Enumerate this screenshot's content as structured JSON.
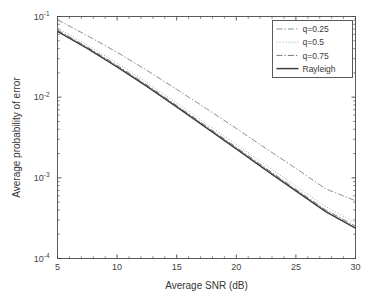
{
  "figure": {
    "background_color": "#ffffff",
    "frame_color": "#4a4a4a"
  },
  "axis": {
    "x_title": "Average SNR (dB)",
    "y_title": "Average probability of error",
    "x_ticks": [
      "5",
      "10",
      "15",
      "20",
      "25",
      "30"
    ],
    "y_ticks": [
      {
        "mantissa": "10",
        "exponent": "-1"
      },
      {
        "mantissa": "10",
        "exponent": "-2"
      },
      {
        "mantissa": "10",
        "exponent": "-3"
      },
      {
        "mantissa": "10",
        "exponent": "-4"
      }
    ]
  },
  "legend": {
    "entries": [
      {
        "label": "q=0.25",
        "style": "dashdot",
        "color": "#8f8f8f"
      },
      {
        "label": "q=0.5",
        "style": "dotted",
        "color": "#a8a8a8"
      },
      {
        "label": "q=0.75",
        "style": "dashdot",
        "color": "#777777"
      },
      {
        "label": "Rayleigh",
        "style": "solid",
        "color": "#3c3c3c"
      }
    ]
  },
  "chart_data": {
    "type": "line",
    "title": "",
    "xlabel": "Average SNR (dB)",
    "ylabel": "Average probability of error",
    "xlim": [
      5,
      30
    ],
    "ylim": [
      0.0001,
      0.1
    ],
    "yscale": "log",
    "xscale": "linear",
    "grid": false,
    "legend_position": "upper-right",
    "x": [
      5,
      7.5,
      10,
      12.5,
      15,
      17.5,
      20,
      22.5,
      25,
      27.5,
      30
    ],
    "series": [
      {
        "name": "q=0.25",
        "style": "dashdot",
        "values": [
          0.091,
          0.058,
          0.036,
          0.0215,
          0.0125,
          0.0072,
          0.0041,
          0.0023,
          0.00131,
          0.00073,
          0.00052
        ]
      },
      {
        "name": "q=0.5",
        "style": "dotted",
        "values": [
          0.072,
          0.0445,
          0.0265,
          0.0152,
          0.0085,
          0.0047,
          0.0026,
          0.00143,
          0.00079,
          0.00044,
          0.000275
        ]
      },
      {
        "name": "q=0.75",
        "style": "dashdot",
        "values": [
          0.068,
          0.0418,
          0.0248,
          0.0142,
          0.0079,
          0.00435,
          0.00239,
          0.00131,
          0.00072,
          0.0004,
          0.000252
        ]
      },
      {
        "name": "Rayleigh",
        "style": "solid",
        "values": [
          0.0655,
          0.0402,
          0.0238,
          0.0136,
          0.00758,
          0.00417,
          0.00229,
          0.00125,
          0.00069,
          0.000381,
          0.000238
        ]
      }
    ]
  }
}
